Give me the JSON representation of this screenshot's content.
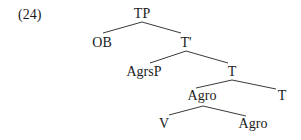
{
  "example_number": "(24)",
  "tree": {
    "nodes": [
      {
        "id": "TP",
        "label": "TP",
        "x": 142,
        "y": 6
      },
      {
        "id": "OB",
        "label": "OB",
        "x": 102,
        "y": 35
      },
      {
        "id": "Tbar",
        "label": "T'",
        "x": 186,
        "y": 35
      },
      {
        "id": "AgrsP",
        "label": "AgrsP",
        "x": 144,
        "y": 64
      },
      {
        "id": "T_mid",
        "label": "T",
        "x": 232,
        "y": 64
      },
      {
        "id": "Agro_mid",
        "label": "Agro",
        "x": 202,
        "y": 88
      },
      {
        "id": "T_right",
        "label": "T",
        "x": 282,
        "y": 88
      },
      {
        "id": "V",
        "label": "V",
        "x": 164,
        "y": 116
      },
      {
        "id": "Agro_bottom",
        "label": "Agro",
        "x": 253,
        "y": 116
      }
    ],
    "edges": [
      {
        "from": "TP",
        "to": "OB",
        "x1": 142,
        "y1": 22,
        "x2": 103,
        "y2": 33
      },
      {
        "from": "TP",
        "to": "Tbar",
        "x1": 142,
        "y1": 22,
        "x2": 181,
        "y2": 33
      },
      {
        "from": "Tbar",
        "to": "AgrsP",
        "x1": 186,
        "y1": 51,
        "x2": 150,
        "y2": 63
      },
      {
        "from": "Tbar",
        "to": "T_mid",
        "x1": 186,
        "y1": 51,
        "x2": 228,
        "y2": 63
      },
      {
        "from": "T_mid",
        "to": "Agro_mid",
        "x1": 232,
        "y1": 80,
        "x2": 196,
        "y2": 88
      },
      {
        "from": "T_mid",
        "to": "T_right",
        "x1": 232,
        "y1": 80,
        "x2": 276,
        "y2": 89
      },
      {
        "from": "Agro_mid",
        "to": "V",
        "x1": 203,
        "y1": 106,
        "x2": 169,
        "y2": 115
      },
      {
        "from": "Agro_mid",
        "to": "Agro_bottom",
        "x1": 203,
        "y1": 106,
        "x2": 246,
        "y2": 116
      }
    ]
  }
}
